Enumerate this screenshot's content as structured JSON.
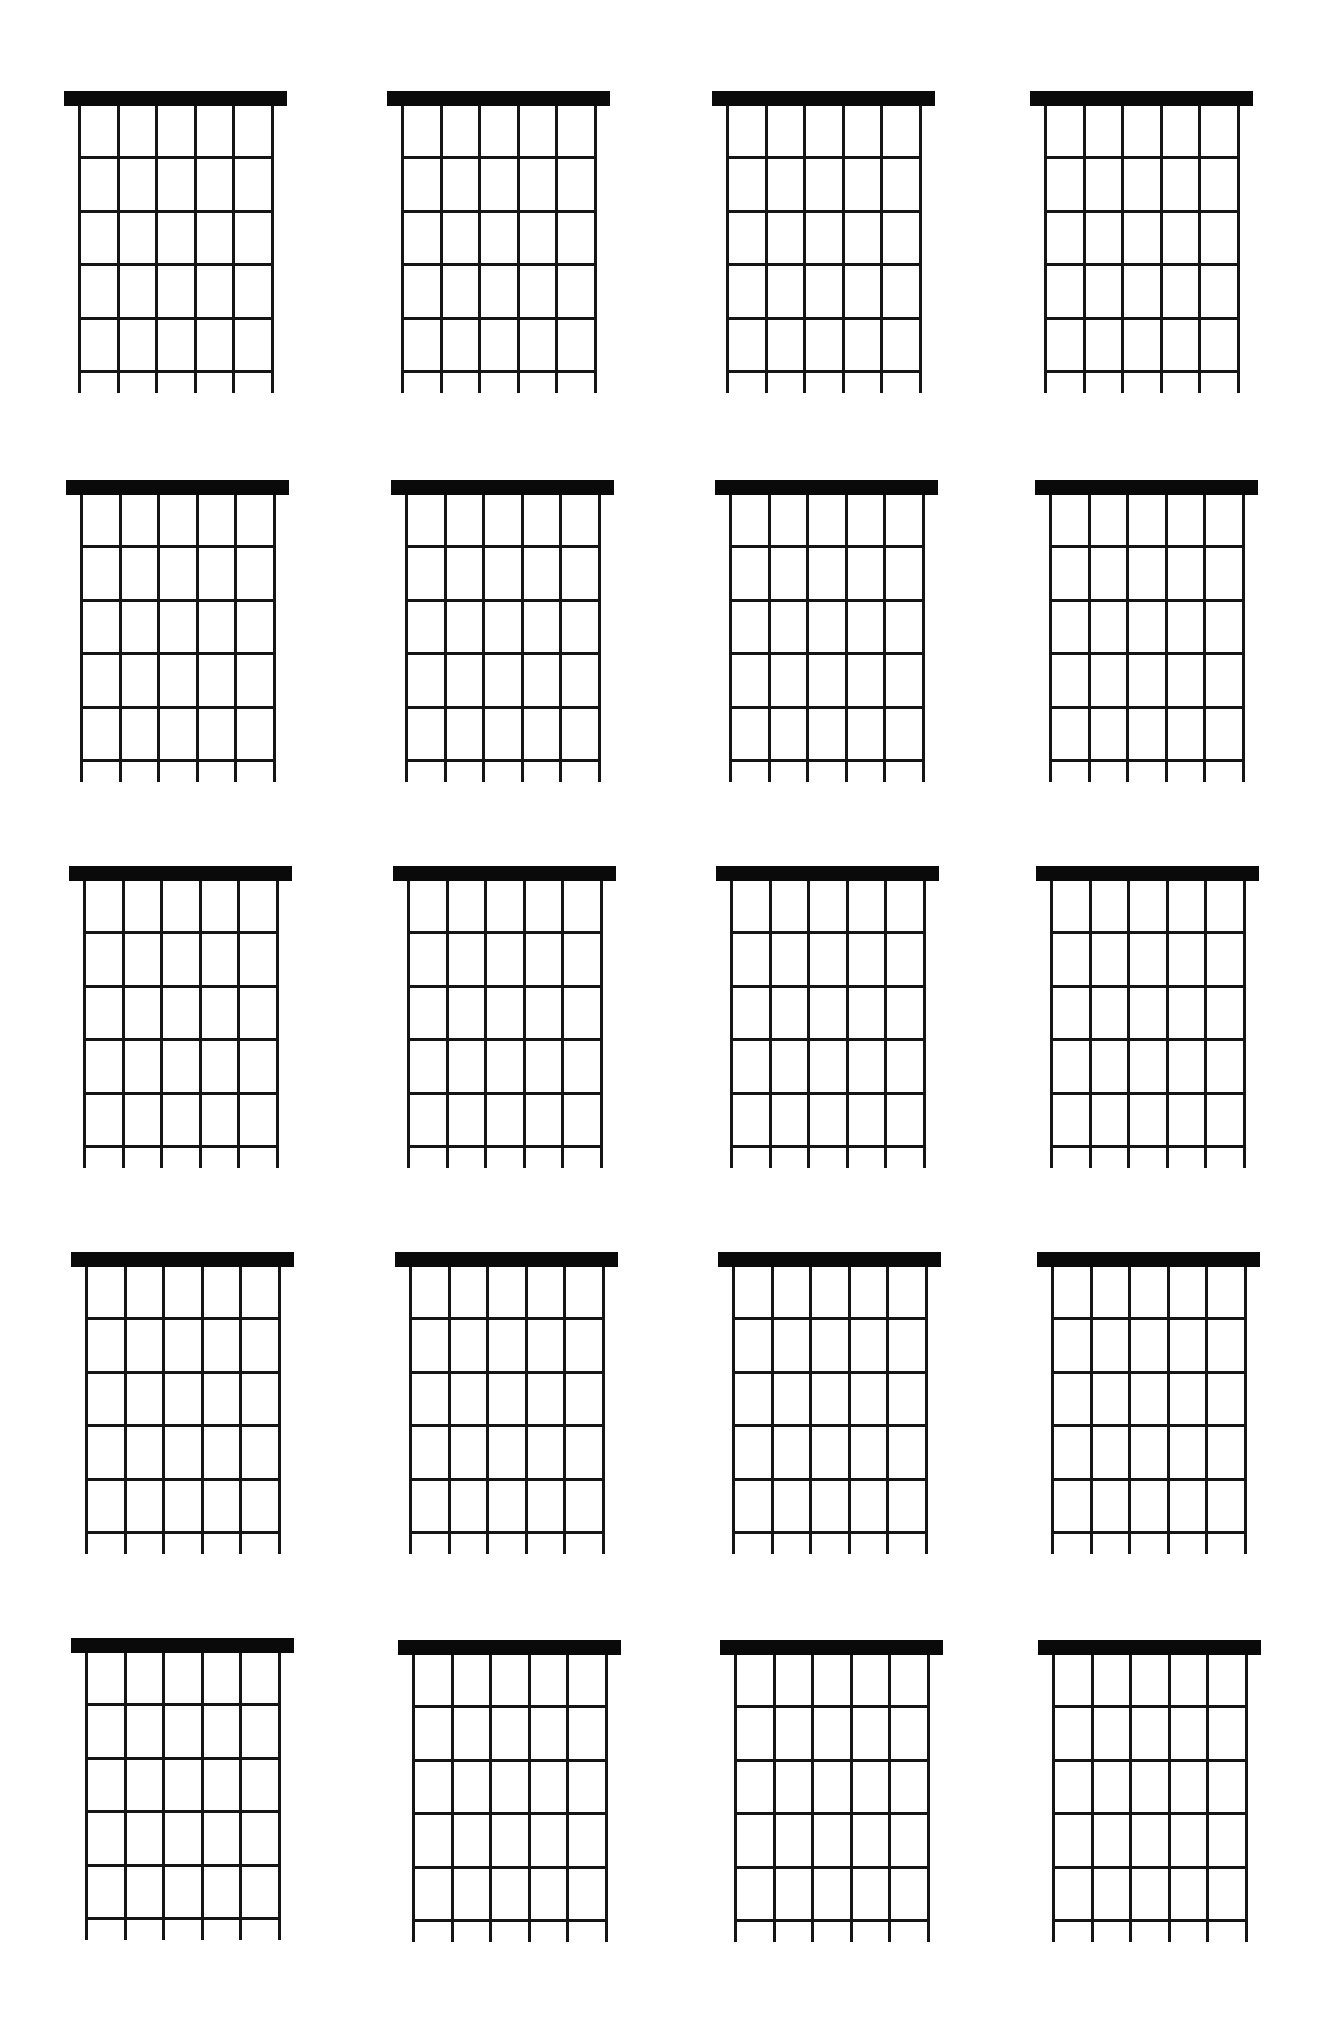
{
  "sheet": {
    "title": "",
    "background": "#ffffff",
    "ink": "#0a0a0a",
    "rows": 5,
    "columns": 4
  },
  "diagram_spec": {
    "strings": 6,
    "frets": 5,
    "nut_height": 15,
    "nut_overhang": 15,
    "string_span": 193,
    "fret_spacing": 53.5,
    "first_fret_gap": 51,
    "tail_length": 22
  },
  "diagrams": [
    {
      "id": 1,
      "row": 1,
      "col": 1,
      "nut_x": 64,
      "nut_y": 91,
      "label": "",
      "markers": []
    },
    {
      "id": 2,
      "row": 1,
      "col": 2,
      "nut_x": 387,
      "nut_y": 91,
      "label": "",
      "markers": []
    },
    {
      "id": 3,
      "row": 1,
      "col": 3,
      "nut_x": 712,
      "nut_y": 91,
      "label": "",
      "markers": []
    },
    {
      "id": 4,
      "row": 1,
      "col": 4,
      "nut_x": 1030,
      "nut_y": 91,
      "label": "",
      "markers": []
    },
    {
      "id": 5,
      "row": 2,
      "col": 1,
      "nut_x": 66,
      "nut_y": 480,
      "label": "",
      "markers": []
    },
    {
      "id": 6,
      "row": 2,
      "col": 2,
      "nut_x": 391,
      "nut_y": 480,
      "label": "",
      "markers": []
    },
    {
      "id": 7,
      "row": 2,
      "col": 3,
      "nut_x": 715,
      "nut_y": 480,
      "label": "",
      "markers": []
    },
    {
      "id": 8,
      "row": 2,
      "col": 4,
      "nut_x": 1035,
      "nut_y": 480,
      "label": "",
      "markers": []
    },
    {
      "id": 9,
      "row": 3,
      "col": 1,
      "nut_x": 69,
      "nut_y": 866,
      "label": "",
      "markers": []
    },
    {
      "id": 10,
      "row": 3,
      "col": 2,
      "nut_x": 393,
      "nut_y": 866,
      "label": "",
      "markers": []
    },
    {
      "id": 11,
      "row": 3,
      "col": 3,
      "nut_x": 716,
      "nut_y": 866,
      "label": "",
      "markers": []
    },
    {
      "id": 12,
      "row": 3,
      "col": 4,
      "nut_x": 1036,
      "nut_y": 866,
      "label": "",
      "markers": []
    },
    {
      "id": 13,
      "row": 4,
      "col": 1,
      "nut_x": 71,
      "nut_y": 1252,
      "label": "",
      "markers": []
    },
    {
      "id": 14,
      "row": 4,
      "col": 2,
      "nut_x": 395,
      "nut_y": 1252,
      "label": "",
      "markers": []
    },
    {
      "id": 15,
      "row": 4,
      "col": 3,
      "nut_x": 718,
      "nut_y": 1252,
      "label": "",
      "markers": []
    },
    {
      "id": 16,
      "row": 4,
      "col": 4,
      "nut_x": 1037,
      "nut_y": 1252,
      "label": "",
      "markers": []
    },
    {
      "id": 17,
      "row": 5,
      "col": 1,
      "nut_x": 71,
      "nut_y": 1638,
      "label": "",
      "markers": []
    },
    {
      "id": 18,
      "row": 5,
      "col": 2,
      "nut_x": 398,
      "nut_y": 1640,
      "label": "",
      "markers": []
    },
    {
      "id": 19,
      "row": 5,
      "col": 3,
      "nut_x": 720,
      "nut_y": 1640,
      "label": "",
      "markers": []
    },
    {
      "id": 20,
      "row": 5,
      "col": 4,
      "nut_x": 1038,
      "nut_y": 1640,
      "label": "",
      "markers": []
    }
  ]
}
